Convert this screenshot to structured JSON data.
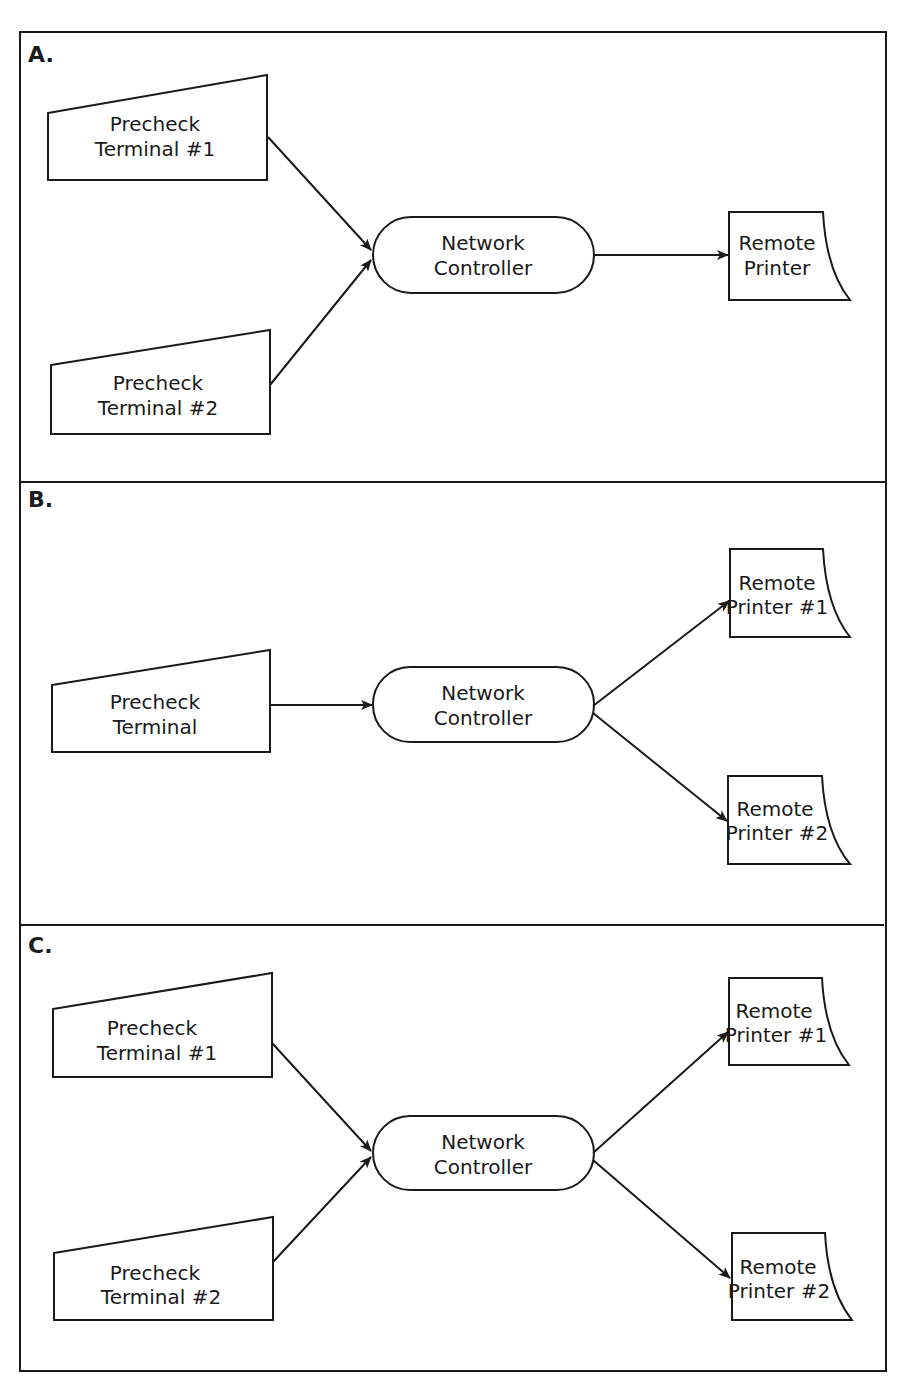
{
  "diagram": {
    "panels": [
      {
        "label": "A.",
        "terminals": [
          {
            "line1": "Precheck",
            "line2": "Terminal #1"
          },
          {
            "line1": "Precheck",
            "line2": "Terminal #2"
          }
        ],
        "controller": {
          "line1": "Network",
          "line2": "Controller"
        },
        "printers": [
          {
            "line1": "Remote",
            "line2": "Printer"
          }
        ]
      },
      {
        "label": "B.",
        "terminals": [
          {
            "line1": "Precheck",
            "line2": "Terminal"
          }
        ],
        "controller": {
          "line1": "Network",
          "line2": "Controller"
        },
        "printers": [
          {
            "line1": "Remote",
            "line2": "Printer #1"
          },
          {
            "line1": "Remote",
            "line2": "Printer #2"
          }
        ]
      },
      {
        "label": "C.",
        "terminals": [
          {
            "line1": "Precheck",
            "line2": "Terminal #1"
          },
          {
            "line1": "Precheck",
            "line2": "Terminal #2"
          }
        ],
        "controller": {
          "line1": "Network",
          "line2": "Controller"
        },
        "printers": [
          {
            "line1": "Remote",
            "line2": "Printer #1"
          },
          {
            "line1": "Remote",
            "line2": "Printer #2"
          }
        ]
      }
    ],
    "colors": {
      "ink": "#1a1a1a",
      "paper": "#ffffff"
    }
  }
}
